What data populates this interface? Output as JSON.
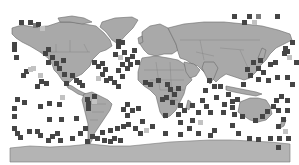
{
  "map": {
    "projection": "equirectangular-world",
    "colors": {
      "background": "#ffffff",
      "land": "#a9a9a9",
      "land_border": "#6a6a6a",
      "cell_dark": "#454545",
      "cell_mid": "#7d7d7d",
      "cell_light": "#c2c2c2"
    },
    "cell_size": 5,
    "cells": [
      [
        19,
        20,
        "d"
      ],
      [
        28,
        20,
        "d"
      ],
      [
        33,
        23,
        "m"
      ],
      [
        36,
        22,
        "d"
      ],
      [
        40,
        26,
        "l"
      ],
      [
        12,
        42,
        "d"
      ],
      [
        12,
        47,
        "d"
      ],
      [
        14,
        55,
        "d"
      ],
      [
        43,
        51,
        "d"
      ],
      [
        46,
        47,
        "d"
      ],
      [
        50,
        55,
        "d"
      ],
      [
        46,
        60,
        "d"
      ],
      [
        54,
        61,
        "d"
      ],
      [
        57,
        66,
        "d"
      ],
      [
        61,
        58,
        "d"
      ],
      [
        24,
        69,
        "d"
      ],
      [
        28,
        67,
        "l"
      ],
      [
        31,
        66,
        "l"
      ],
      [
        21,
        73,
        "d"
      ],
      [
        38,
        73,
        "l"
      ],
      [
        62,
        72,
        "d"
      ],
      [
        44,
        81,
        "d"
      ],
      [
        39,
        79,
        "d"
      ],
      [
        35,
        84,
        "d"
      ],
      [
        70,
        73,
        "d"
      ],
      [
        74,
        78,
        "d"
      ],
      [
        64,
        81,
        "d"
      ],
      [
        77,
        80,
        "d"
      ],
      [
        80,
        83,
        "d"
      ],
      [
        92,
        60,
        "d"
      ],
      [
        96,
        64,
        "d"
      ],
      [
        100,
        61,
        "d"
      ],
      [
        103,
        67,
        "d"
      ],
      [
        100,
        72,
        "d"
      ],
      [
        96,
        76,
        "l"
      ],
      [
        104,
        78,
        "d"
      ],
      [
        108,
        76,
        "d"
      ],
      [
        116,
        39,
        "d"
      ],
      [
        116,
        44,
        "d"
      ],
      [
        120,
        40,
        "d"
      ],
      [
        113,
        52,
        "d"
      ],
      [
        118,
        55,
        "l"
      ],
      [
        122,
        50,
        "d"
      ],
      [
        125,
        57,
        "d"
      ],
      [
        120,
        62,
        "d"
      ],
      [
        116,
        68,
        "d"
      ],
      [
        120,
        74,
        "d"
      ],
      [
        125,
        66,
        "d"
      ],
      [
        128,
        62,
        "d"
      ],
      [
        112,
        80,
        "d"
      ],
      [
        116,
        84,
        "d"
      ],
      [
        22,
        100,
        "d"
      ],
      [
        15,
        97,
        "d"
      ],
      [
        12,
        106,
        "d"
      ],
      [
        12,
        114,
        "d"
      ],
      [
        57,
        102,
        "d"
      ],
      [
        60,
        95,
        "l"
      ],
      [
        38,
        104,
        "d"
      ],
      [
        47,
        101,
        "d"
      ],
      [
        74,
        116,
        "d"
      ],
      [
        47,
        117,
        "d"
      ],
      [
        59,
        117,
        "d"
      ],
      [
        12,
        126,
        "d"
      ],
      [
        15,
        131,
        "d"
      ],
      [
        18,
        135,
        "d"
      ],
      [
        27,
        129,
        "d"
      ],
      [
        35,
        129,
        "d"
      ],
      [
        38,
        133,
        "d"
      ],
      [
        50,
        134,
        "d"
      ],
      [
        55,
        131,
        "d"
      ],
      [
        46,
        138,
        "d"
      ],
      [
        58,
        138,
        "d"
      ],
      [
        70,
        136,
        "d"
      ],
      [
        78,
        131,
        "d"
      ],
      [
        83,
        126,
        "d"
      ],
      [
        85,
        97,
        "d"
      ],
      [
        86,
        101,
        "d"
      ],
      [
        86,
        106,
        "d"
      ],
      [
        92,
        94,
        "d"
      ],
      [
        92,
        99,
        "l"
      ],
      [
        121,
        107,
        "d"
      ],
      [
        125,
        102,
        "d"
      ],
      [
        125,
        113,
        "d"
      ],
      [
        130,
        108,
        "d"
      ],
      [
        136,
        106,
        "d"
      ],
      [
        121,
        124,
        "d"
      ],
      [
        126,
        122,
        "d"
      ],
      [
        133,
        126,
        "d"
      ],
      [
        138,
        131,
        "d"
      ],
      [
        150,
        124,
        "d"
      ],
      [
        140,
        119,
        "d"
      ],
      [
        144,
        128,
        "l"
      ],
      [
        108,
        128,
        "d"
      ],
      [
        115,
        126,
        "d"
      ],
      [
        100,
        130,
        "d"
      ],
      [
        160,
        97,
        "d"
      ],
      [
        164,
        95,
        "d"
      ],
      [
        170,
        100,
        "d"
      ],
      [
        178,
        103,
        "d"
      ],
      [
        190,
        103,
        "d"
      ],
      [
        182,
        108,
        "d"
      ],
      [
        176,
        112,
        "d"
      ],
      [
        163,
        113,
        "d"
      ],
      [
        178,
        120,
        "d"
      ],
      [
        190,
        118,
        "d"
      ],
      [
        198,
        120,
        "l"
      ],
      [
        187,
        126,
        "d"
      ],
      [
        163,
        131,
        "d"
      ],
      [
        178,
        132,
        "d"
      ],
      [
        196,
        131,
        "d"
      ],
      [
        208,
        133,
        "d"
      ],
      [
        212,
        128,
        "d"
      ],
      [
        207,
        78,
        "d"
      ],
      [
        212,
        84,
        "d"
      ],
      [
        203,
        88,
        "d"
      ],
      [
        200,
        98,
        "d"
      ],
      [
        204,
        104,
        "d"
      ],
      [
        214,
        95,
        "d"
      ],
      [
        222,
        102,
        "d"
      ],
      [
        230,
        99,
        "d"
      ],
      [
        235,
        97,
        "d"
      ],
      [
        226,
        92,
        "d"
      ],
      [
        230,
        105,
        "d"
      ],
      [
        232,
        112,
        "d"
      ],
      [
        230,
        123,
        "d"
      ],
      [
        236,
        131,
        "d"
      ],
      [
        221,
        110,
        "d"
      ],
      [
        240,
        114,
        "d"
      ],
      [
        247,
        136,
        "d"
      ],
      [
        256,
        137,
        "d"
      ],
      [
        268,
        136,
        "d"
      ],
      [
        253,
        118,
        "d"
      ],
      [
        260,
        114,
        "d"
      ],
      [
        265,
        109,
        "d"
      ],
      [
        271,
        104,
        "d"
      ],
      [
        276,
        108,
        "d"
      ],
      [
        274,
        98,
        "d"
      ],
      [
        279,
        94,
        "d"
      ],
      [
        285,
        98,
        "d"
      ],
      [
        285,
        108,
        "d"
      ],
      [
        281,
        117,
        "d"
      ],
      [
        276,
        124,
        "d"
      ],
      [
        283,
        129,
        "l"
      ],
      [
        277,
        136,
        "d"
      ],
      [
        286,
        136,
        "d"
      ],
      [
        256,
        77,
        "d"
      ],
      [
        266,
        78,
        "d"
      ],
      [
        261,
        70,
        "d"
      ],
      [
        256,
        66,
        "d"
      ],
      [
        273,
        60,
        "d"
      ],
      [
        268,
        62,
        "d"
      ],
      [
        283,
        46,
        "d"
      ],
      [
        282,
        51,
        "d"
      ],
      [
        287,
        55,
        "l"
      ],
      [
        290,
        40,
        "d"
      ],
      [
        294,
        60,
        "d"
      ],
      [
        275,
        75,
        "d"
      ],
      [
        285,
        75,
        "d"
      ],
      [
        290,
        82,
        "d"
      ],
      [
        245,
        67,
        "d"
      ],
      [
        248,
        73,
        "d"
      ],
      [
        251,
        60,
        "d"
      ],
      [
        258,
        58,
        "d"
      ],
      [
        232,
        14,
        "d"
      ],
      [
        247,
        14,
        "d"
      ],
      [
        256,
        14,
        "m"
      ],
      [
        275,
        14,
        "d"
      ],
      [
        252,
        20,
        "l"
      ],
      [
        242,
        20,
        "d"
      ],
      [
        285,
        49,
        "d"
      ],
      [
        218,
        84,
        "d"
      ],
      [
        241,
        82,
        "d"
      ],
      [
        208,
        110,
        "d"
      ],
      [
        196,
        110,
        "d"
      ],
      [
        168,
        87,
        "d"
      ],
      [
        172,
        92,
        "d"
      ],
      [
        176,
        86,
        "d"
      ],
      [
        130,
        54,
        "d"
      ],
      [
        132,
        48,
        "d"
      ],
      [
        135,
        60,
        "d"
      ],
      [
        143,
        80,
        "d"
      ],
      [
        148,
        82,
        "d"
      ],
      [
        156,
        78,
        "d"
      ],
      [
        165,
        82,
        "d"
      ],
      [
        85,
        139,
        "d"
      ],
      [
        90,
        134,
        "d"
      ],
      [
        95,
        136,
        "d"
      ],
      [
        102,
        138,
        "d"
      ],
      [
        108,
        139,
        "d"
      ],
      [
        112,
        136,
        "d"
      ],
      [
        118,
        138,
        "d"
      ],
      [
        276,
        145,
        "d"
      ]
    ]
  }
}
